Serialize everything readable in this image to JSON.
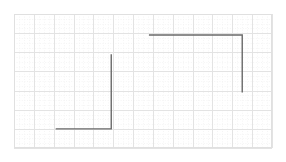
{
  "chart_data": {
    "type": "line",
    "title": "",
    "subtitle": "",
    "xlabel": "",
    "ylabel": "",
    "xlim": [
      0,
      13
    ],
    "ylim": [
      0,
      7
    ],
    "grid": true,
    "grid_major_x": [
      0,
      1,
      2,
      3,
      4,
      5,
      6,
      7,
      8,
      9,
      10,
      11,
      12,
      13
    ],
    "grid_major_y": [
      0,
      1,
      2,
      3,
      4,
      5,
      6,
      7
    ],
    "grid_minor_per_cell": 4,
    "legend": "none",
    "xticklabels": [],
    "yticklabels": [],
    "line_color": "#6a6a6a",
    "major_grid_color": "#e3e3e3",
    "minor_grid_color": "#f2f2f2",
    "frame_color": "#e0e0e0",
    "background_color": "#ffffff",
    "series": [
      {
        "name": "left-step",
        "points": [
          {
            "x": 2.1,
            "y": 1.0
          },
          {
            "x": 4.9,
            "y": 1.0
          },
          {
            "x": 4.9,
            "y": 4.9
          }
        ]
      },
      {
        "name": "right-step",
        "points": [
          {
            "x": 6.8,
            "y": 5.9
          },
          {
            "x": 11.5,
            "y": 5.9
          },
          {
            "x": 11.5,
            "y": 2.9
          }
        ]
      }
    ]
  },
  "figure": {
    "width": 286,
    "height": 162,
    "plot_left": 14,
    "plot_top": 14,
    "plot_width": 258,
    "plot_height": 134
  }
}
